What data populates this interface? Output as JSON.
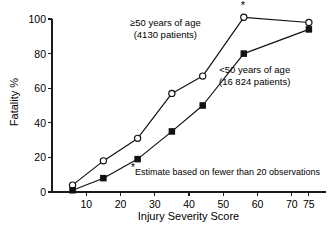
{
  "chart_data": {
    "type": "line",
    "title": "",
    "xlabel": "Injury Severity Score",
    "ylabel": "Fatality %",
    "xlim": [
      0,
      80
    ],
    "ylim": [
      0,
      105
    ],
    "xticks": [
      10,
      20,
      30,
      40,
      50,
      60,
      70,
      75
    ],
    "yticks": [
      0,
      20,
      40,
      60,
      80,
      100
    ],
    "grid": false,
    "legend": "inline-annotations",
    "series": [
      {
        "name": "≥50 years of age",
        "marker": "open-circle",
        "patients": "4130 patients",
        "x": [
          6,
          15,
          25,
          35,
          44,
          56,
          75
        ],
        "y": [
          4,
          18,
          31,
          57,
          67,
          101,
          98
        ]
      },
      {
        "name": "<50 years of age",
        "marker": "filled-square",
        "patients": "16 824 patients",
        "x": [
          6,
          15,
          25,
          35,
          44,
          56,
          75
        ],
        "y": [
          1,
          8,
          19,
          35,
          50,
          80,
          94
        ]
      }
    ],
    "annotations": [
      {
        "name": "older-group-label",
        "line1": "≥50 years of age",
        "line2": "(4130 patients)"
      },
      {
        "name": "younger-group-label",
        "line1": "<50 years of age",
        "line2": "(16 824 patients)"
      }
    ],
    "footnote": {
      "marker": "*",
      "text": "Estimate based on fewer than 20 observations"
    },
    "peak_marker": {
      "symbol": "*",
      "at_x": 56,
      "at_y": 101
    },
    "colors": {
      "line": "#111111",
      "axis": "#1a1a1a",
      "background": "#ffffff",
      "marker_fill_open": "#ffffff",
      "marker_fill_closed": "#111111"
    }
  },
  "axis": {
    "y_title": "Fatality %",
    "x_title": "Injury Severity Score",
    "y_tick_labels": [
      "0",
      "20",
      "40",
      "60",
      "80",
      "100"
    ],
    "x_tick_labels": [
      "10",
      "20",
      "30",
      "40",
      "50",
      "60",
      "70",
      "75"
    ]
  }
}
